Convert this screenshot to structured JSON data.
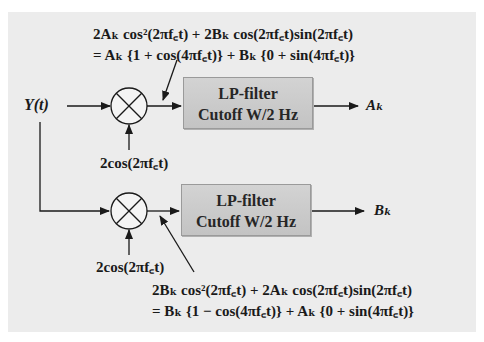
{
  "diagram": {
    "input_label": "Y(t)",
    "top_branch": {
      "equation_line1": "2Aₖ cos²(2πf꜀t) + 2Bₖ cos(2πf꜀t)sin(2πf꜀t)",
      "equation_line2": "= Aₖ {1 + cos(4πf꜀t)} + Bₖ {0 + sin(4πf꜀t)}",
      "filter_line1": "LP-filter",
      "filter_line2": "Cutoff W/2 Hz",
      "oscillator_label": "2cos(2πf꜀t)",
      "output_label": "Aₖ"
    },
    "bottom_branch": {
      "equation_line1": "2Bₖ cos²(2πf꜀t) + 2Aₖ cos(2πf꜀t)sin(2πf꜀t)",
      "equation_line2": "= Bₖ {1 − cos(4πf꜀t)} + Aₖ {0 + sin(4πf꜀t)}",
      "filter_line1": "LP-filter",
      "filter_line2": "Cutoff W/2 Hz",
      "oscillator_label": "2cos(2πf꜀t)",
      "output_label": "Bₖ"
    }
  }
}
